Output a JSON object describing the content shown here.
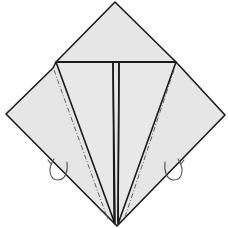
{
  "diagram": {
    "type": "origami-fold-step",
    "title": "",
    "colors": {
      "paper": "#e6e6e6",
      "line": "#1a1a1a",
      "arrow": "#555555",
      "background": "#ffffff"
    },
    "elements": [
      {
        "name": "square-base-outline",
        "kind": "diamond"
      },
      {
        "name": "horizontal-fold-line",
        "kind": "valley-fold"
      },
      {
        "name": "center-slit",
        "kind": "edge"
      },
      {
        "name": "left-kite-flap",
        "kind": "flap"
      },
      {
        "name": "right-kite-flap",
        "kind": "flap"
      },
      {
        "name": "left-mountain-fold-line",
        "kind": "mountain-fold"
      },
      {
        "name": "right-mountain-fold-line",
        "kind": "mountain-fold"
      },
      {
        "name": "left-fold-behind-arrow",
        "kind": "arrow"
      },
      {
        "name": "right-fold-behind-arrow",
        "kind": "arrow"
      }
    ]
  }
}
